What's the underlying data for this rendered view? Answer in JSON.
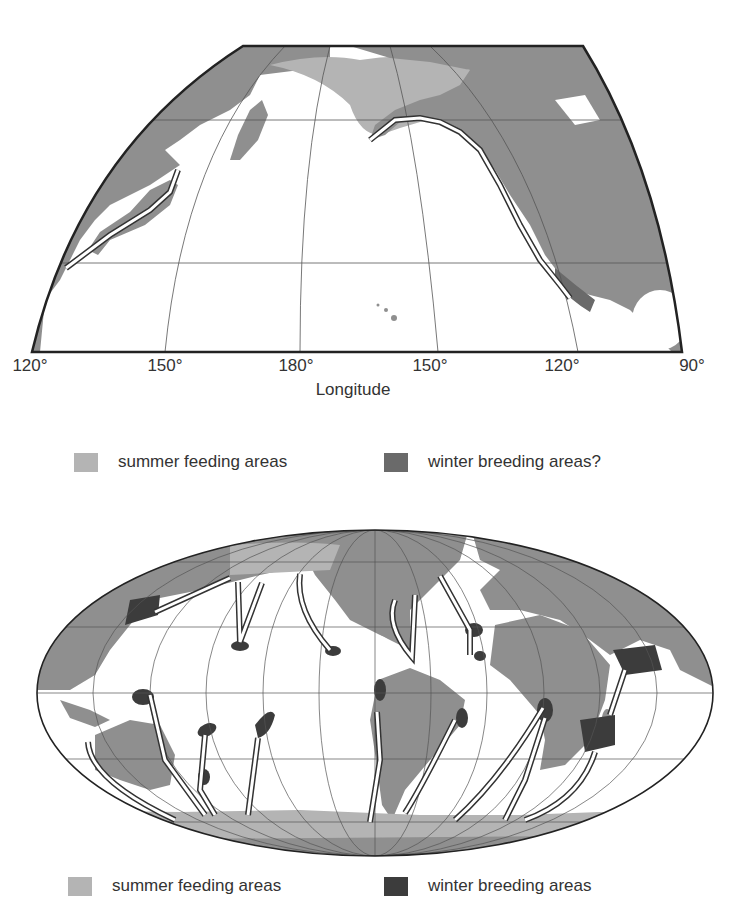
{
  "colors": {
    "land": "#8f8f8f",
    "summer_feeding": "#b4b4b4",
    "winter_breeding_possible": "#6a6a6a",
    "winter_breeding": "#3c3c3c",
    "ocean": "#ffffff",
    "route_outline": "#333333"
  },
  "north_pacific_map": {
    "x_axis": {
      "title": "Longitude",
      "ticks": [
        "120°",
        "150°",
        "180°",
        "150°",
        "120°",
        "90°"
      ]
    },
    "legend": [
      {
        "label": "summer feeding areas",
        "swatch": "summer_feeding"
      },
      {
        "label": "winter breeding areas?",
        "swatch": "winter_breeding_possible"
      }
    ]
  },
  "world_map": {
    "projection": "Mollweide",
    "legend": [
      {
        "label": "summer feeding areas",
        "swatch": "summer_feeding"
      },
      {
        "label": "winter breeding areas",
        "swatch": "winter_breeding"
      }
    ]
  }
}
